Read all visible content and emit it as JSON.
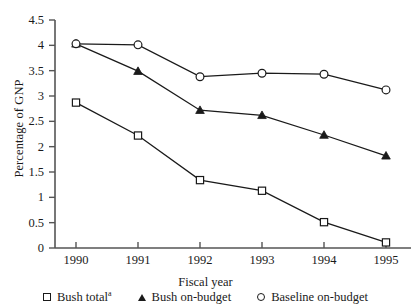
{
  "chart_data": {
    "type": "line",
    "title": "",
    "xlabel": "Fiscal year",
    "ylabel": "Percentage of GNP",
    "categories": [
      "1990",
      "1991",
      "1992",
      "1993",
      "1994",
      "1995"
    ],
    "x_tick_labels": [
      "1990",
      "1991",
      "1992",
      "1993",
      "1994",
      "1995"
    ],
    "y_tick_labels": [
      "0",
      "0.5",
      "1",
      "1.5",
      "2",
      "2.5",
      "3",
      "3.5",
      "4",
      "4.5"
    ],
    "y_tick_values": [
      0,
      0.5,
      1,
      1.5,
      2,
      2.5,
      3,
      3.5,
      4,
      4.5
    ],
    "ylim": [
      0,
      4.5
    ],
    "xlim": [
      1990,
      1995
    ],
    "grid": false,
    "legend_position": "bottom",
    "series": [
      {
        "name": "Bush total",
        "name_superscript": "a",
        "marker": "open-square",
        "values": [
          2.87,
          2.22,
          1.34,
          1.13,
          0.51,
          0.11
        ]
      },
      {
        "name": "Bush on-budget",
        "name_superscript": "",
        "marker": "filled-triangle",
        "values": [
          4.03,
          3.49,
          2.72,
          2.62,
          2.23,
          1.82
        ]
      },
      {
        "name": "Baseline on-budget",
        "name_superscript": "",
        "marker": "open-circle",
        "values": [
          4.03,
          4.01,
          3.38,
          3.45,
          3.43,
          3.12
        ]
      }
    ]
  },
  "axes": {
    "y_title": "Percentage of GNP",
    "x_title": "Fiscal year"
  },
  "legend": {
    "items": [
      {
        "label": "Bush total",
        "superscript": "a",
        "marker": "open-square"
      },
      {
        "label": "Bush on-budget",
        "superscript": "",
        "marker": "filled-triangle"
      },
      {
        "label": "Baseline on-budget",
        "superscript": "",
        "marker": "open-circle"
      }
    ]
  },
  "style": {
    "line_color": "#1a1a1a",
    "axis_color": "#555555",
    "background": "#ffffff"
  }
}
